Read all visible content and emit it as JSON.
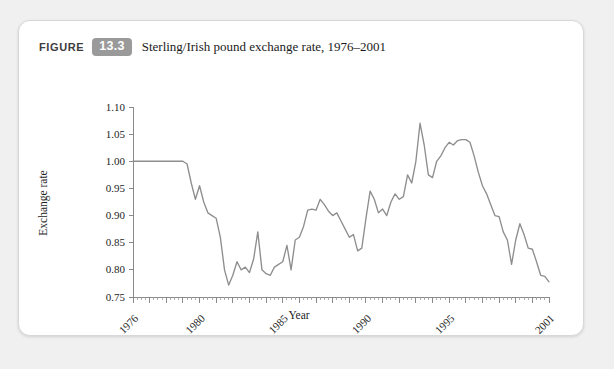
{
  "figure": {
    "label_word": "FIGURE",
    "number": "13.3",
    "title": "Sterling/Irish pound exchange rate, 1976–2001",
    "badge_color": "#9a9a9a",
    "line_color": "#8e8e8e",
    "card_background": "#ffffff",
    "page_background": "#f0f0f0"
  },
  "chart_data": {
    "type": "line",
    "title": "Sterling/Irish pound exchange rate, 1976–2001",
    "xlabel": "Year",
    "ylabel": "Exchange rate",
    "xlim": [
      1976,
      2001
    ],
    "ylim": [
      0.75,
      1.1
    ],
    "ytick_values": [
      0.75,
      0.8,
      0.85,
      0.9,
      0.95,
      1.0,
      1.05,
      1.1
    ],
    "ytick_labels": [
      "0.75",
      "0.80",
      "0.85",
      "0.90",
      "0.95",
      "1.00",
      "1.05",
      "1.10"
    ],
    "xtick_values": [
      1976,
      1980,
      1985,
      1990,
      1995,
      2001
    ],
    "xtick_labels": [
      "1976",
      "1980",
      "1985",
      "1990",
      "1995",
      "2001"
    ],
    "xtick_rotation": 45,
    "grid": false,
    "legend": false,
    "minor_ticks": "quarterly",
    "series": [
      {
        "name": "Sterling/Irish pound exchange rate",
        "x": [
          1976.0,
          1976.25,
          1976.5,
          1976.75,
          1977.0,
          1977.25,
          1977.5,
          1977.75,
          1978.0,
          1978.25,
          1978.5,
          1978.75,
          1979.0,
          1979.25,
          1979.5,
          1979.75,
          1980.0,
          1980.25,
          1980.5,
          1980.75,
          1981.0,
          1981.25,
          1981.5,
          1981.75,
          1982.0,
          1982.25,
          1982.5,
          1982.75,
          1983.0,
          1983.25,
          1983.5,
          1983.75,
          1984.0,
          1984.25,
          1984.5,
          1984.75,
          1985.0,
          1985.25,
          1985.5,
          1985.75,
          1986.0,
          1986.25,
          1986.5,
          1986.75,
          1987.0,
          1987.25,
          1987.5,
          1987.75,
          1988.0,
          1988.25,
          1988.5,
          1988.75,
          1989.0,
          1989.25,
          1989.5,
          1989.75,
          1990.0,
          1990.25,
          1990.5,
          1990.75,
          1991.0,
          1991.25,
          1991.5,
          1991.75,
          1992.0,
          1992.25,
          1992.5,
          1992.75,
          1993.0,
          1993.25,
          1993.5,
          1993.75,
          1994.0,
          1994.25,
          1994.5,
          1994.75,
          1995.0,
          1995.25,
          1995.5,
          1995.75,
          1996.0,
          1996.25,
          1996.5,
          1996.75,
          1997.0,
          1997.25,
          1997.5,
          1997.75,
          1998.0,
          1998.25,
          1998.5,
          1998.75,
          1999.0,
          1999.25,
          1999.5,
          1999.75,
          2000.0,
          2000.25,
          2000.5,
          2000.75,
          2001.0
        ],
        "y": [
          1.0,
          1.0,
          1.0,
          1.0,
          1.0,
          1.0,
          1.0,
          1.0,
          1.0,
          1.0,
          1.0,
          1.0,
          1.0,
          0.995,
          0.96,
          0.93,
          0.955,
          0.925,
          0.905,
          0.9,
          0.895,
          0.86,
          0.8,
          0.772,
          0.79,
          0.815,
          0.8,
          0.805,
          0.795,
          0.82,
          0.87,
          0.8,
          0.793,
          0.79,
          0.805,
          0.81,
          0.815,
          0.845,
          0.8,
          0.855,
          0.86,
          0.88,
          0.91,
          0.912,
          0.91,
          0.93,
          0.92,
          0.908,
          0.9,
          0.905,
          0.89,
          0.875,
          0.86,
          0.865,
          0.835,
          0.84,
          0.895,
          0.945,
          0.93,
          0.905,
          0.912,
          0.9,
          0.925,
          0.94,
          0.93,
          0.935,
          0.975,
          0.96,
          1.0,
          1.07,
          1.03,
          0.975,
          0.97,
          1.0,
          1.01,
          1.025,
          1.035,
          1.03,
          1.038,
          1.04,
          1.04,
          1.035,
          1.01,
          0.98,
          0.955,
          0.94,
          0.92,
          0.9,
          0.898,
          0.87,
          0.855,
          0.81,
          0.855,
          0.885,
          0.865,
          0.84,
          0.838,
          0.815,
          0.79,
          0.788,
          0.778
        ]
      }
    ]
  }
}
